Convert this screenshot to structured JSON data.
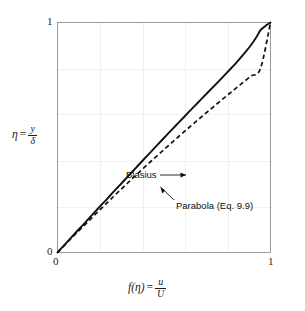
{
  "figure": {
    "background_color": "#ffffff",
    "frame_color": "#9a9a9a",
    "grid_color": "#f0f0f2",
    "curve_color": "#111111"
  },
  "axes": {
    "y": {
      "label_var": "η",
      "label_eq": "=",
      "label_numerator": "y",
      "label_denominator": "δ",
      "min": 0,
      "max": 1,
      "ticks": [
        "0",
        "1"
      ]
    },
    "x": {
      "label_fn": "f(η)",
      "label_eq": "=",
      "label_numerator": "u",
      "label_denominator": "U",
      "min": 0,
      "max": 1,
      "ticks": [
        "0",
        "1"
      ]
    }
  },
  "annotations": {
    "blasius": "Blasius",
    "parabola": "Parabola (Eq. 9.9)"
  },
  "chart_data": {
    "type": "line",
    "title": "",
    "xlabel": "f(η) = u/U",
    "ylabel": "η = y/δ",
    "xlim": [
      0,
      1
    ],
    "ylim": [
      0,
      1
    ],
    "xticks": [
      0,
      1
    ],
    "yticks": [
      0,
      1
    ],
    "xtick_labels": [
      "0",
      "1"
    ],
    "ytick_labels": [
      "0",
      "1"
    ],
    "grid": true,
    "grid_interval": 0.2,
    "legend": "inline-annotations",
    "note": "Boundary-layer velocity profile: vertical axis is eta = y/delta, horizontal axis is f(eta) = u/U. Both curves run from (0,0) to (1,1).",
    "series": [
      {
        "name": "Blasius",
        "style": "solid",
        "color": "#111111",
        "x": [
          0,
          0.033,
          0.066,
          0.099,
          0.133,
          0.166,
          0.199,
          0.233,
          0.266,
          0.3,
          0.333,
          0.367,
          0.4,
          0.434,
          0.468,
          0.502,
          0.536,
          0.571,
          0.605,
          0.64,
          0.675,
          0.71,
          0.745,
          0.78,
          0.814,
          0.847,
          0.878,
          0.907,
          0.932,
          0.953,
          0.97,
          0.983,
          0.992,
          0.997,
          1.0
        ],
        "y": [
          0,
          0.0333,
          0.0667,
          0.1,
          0.1333,
          0.1667,
          0.2,
          0.2333,
          0.2667,
          0.3,
          0.3333,
          0.3667,
          0.4,
          0.4333,
          0.4667,
          0.5,
          0.5333,
          0.5667,
          0.6,
          0.6333,
          0.6667,
          0.7,
          0.7333,
          0.7667,
          0.8,
          0.8333,
          0.8667,
          0.9,
          0.9333,
          0.9667,
          0.98,
          0.99,
          0.995,
          0.998,
          1.0
        ]
      },
      {
        "name": "Parabola (Eq. 9.9)",
        "style": "dashed",
        "color": "#111111",
        "equation": "f = 2*eta - eta^2 (inverse plotted: eta on vertical axis)",
        "x": [
          0,
          0.035,
          0.07,
          0.106,
          0.142,
          0.178,
          0.215,
          0.252,
          0.289,
          0.327,
          0.365,
          0.404,
          0.443,
          0.483,
          0.523,
          0.564,
          0.605,
          0.647,
          0.689,
          0.732,
          0.775,
          0.819,
          0.863,
          0.908,
          0.953,
          1.0
        ],
        "y": [
          0,
          0.0333,
          0.0667,
          0.1,
          0.1333,
          0.1667,
          0.2,
          0.2333,
          0.2667,
          0.3,
          0.3333,
          0.3667,
          0.4,
          0.4333,
          0.4667,
          0.5,
          0.5333,
          0.5667,
          0.6,
          0.6333,
          0.6667,
          0.7,
          0.7333,
          0.7667,
          0.8,
          1.0
        ]
      }
    ]
  }
}
